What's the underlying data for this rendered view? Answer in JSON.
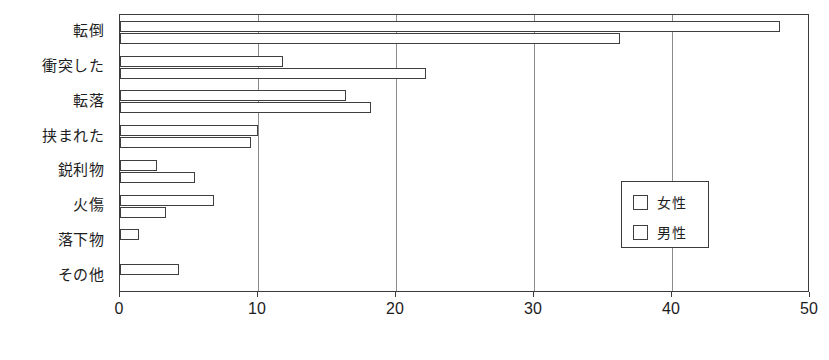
{
  "chart_data": {
    "type": "bar",
    "orientation": "horizontal",
    "title": "",
    "subtitle": "",
    "xlabel": "",
    "ylabel": "",
    "xlim": [
      0,
      50
    ],
    "xticks": [
      "0",
      "10",
      "20",
      "30",
      "40",
      "50"
    ],
    "grid": "vertical",
    "legend_position": "center-right",
    "categories": [
      "転倒",
      "衝突した",
      "転落",
      "挟まれた",
      "鋭利物",
      "火傷",
      "落下物",
      "その他"
    ],
    "series": [
      {
        "name": "女性",
        "values": [
          47.8,
          11.8,
          16.4,
          10.0,
          2.7,
          6.8,
          1.4,
          4.3
        ]
      },
      {
        "name": "男性",
        "values": [
          36.2,
          22.2,
          18.2,
          9.5,
          5.4,
          3.3,
          0,
          0
        ]
      }
    ]
  },
  "legend": {
    "items": [
      {
        "label": "女性",
        "marker": "open-square"
      },
      {
        "label": "男性",
        "marker": "open-square"
      }
    ]
  },
  "axis": {
    "x_tick_labels": [
      "0",
      "10",
      "20",
      "30",
      "40",
      "50"
    ],
    "category_labels": [
      "転倒",
      "衝突した",
      "転落",
      "挟まれた",
      "鋭利物",
      "火傷",
      "落下物",
      "その他"
    ]
  },
  "colors": {
    "bar_fill": "#ffffff",
    "bar_stroke": "#3f3f3f",
    "frame": "#3b3b3b",
    "gridline": "#8c8c8c",
    "text": "#1d1d1d",
    "background": "#ffffff"
  }
}
